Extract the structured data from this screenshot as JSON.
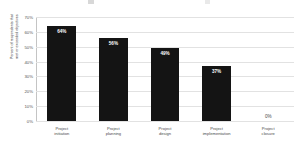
{
  "chart_data": {
    "type": "bar",
    "title": "",
    "xlabel": "",
    "ylabel": "Percent of respondents that\nmet or exceeded objectives",
    "categories": [
      "Project\ninitiation",
      "Project\nplanning",
      "Project\ndesign",
      "Project\nimplementation",
      "Project\nclosure"
    ],
    "values": [
      64,
      56,
      49,
      37,
      0
    ],
    "data_labels": [
      "64%",
      "56%",
      "49%",
      "37%",
      "0%"
    ],
    "ylim": [
      0,
      70
    ],
    "ytick_values": [
      0,
      10,
      20,
      30,
      40,
      50,
      60,
      70
    ],
    "ytick_labels": [
      "0%",
      "10%",
      "20%",
      "30%",
      "40%",
      "50%",
      "60%",
      "70%"
    ],
    "grid": true,
    "legend": false,
    "bar_color": "#141414",
    "gridline_color": "#e2e2e2",
    "axis_color": "#b5b5b5",
    "label_color": "#4a4a4a",
    "background_color": "#ffffff"
  }
}
